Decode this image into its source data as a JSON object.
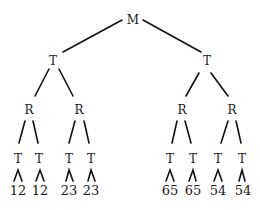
{
  "diagram": {
    "type": "tree",
    "root": {
      "label": "M"
    },
    "level1": [
      {
        "label": "T"
      },
      {
        "label": "T"
      }
    ],
    "level2": [
      {
        "label": "R"
      },
      {
        "label": "R"
      },
      {
        "label": "R"
      },
      {
        "label": "R"
      }
    ],
    "level3": [
      {
        "label": "T"
      },
      {
        "label": "T"
      },
      {
        "label": "T"
      },
      {
        "label": "T"
      },
      {
        "label": "T"
      },
      {
        "label": "T"
      },
      {
        "label": "T"
      },
      {
        "label": "T"
      }
    ],
    "leaves": [
      {
        "label": "12"
      },
      {
        "label": "12"
      },
      {
        "label": "23"
      },
      {
        "label": "23"
      },
      {
        "label": "65"
      },
      {
        "label": "65"
      },
      {
        "label": "54"
      },
      {
        "label": "54"
      }
    ]
  }
}
